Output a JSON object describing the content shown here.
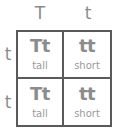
{
  "punnett_square": {
    "column_alleles": [
      "T",
      "t"
    ],
    "row_alleles": [
      "t",
      "t"
    ],
    "cells": [
      [
        {
          "genotype": "Tt",
          "phenotype": "tall"
        },
        {
          "genotype": "tt",
          "phenotype": "short"
        }
      ],
      [
        {
          "genotype": "Tt",
          "phenotype": "tall"
        },
        {
          "genotype": "tt",
          "phenotype": "short"
        }
      ]
    ]
  },
  "colors": {
    "grid_line": "#5a5a5a",
    "text": "#8c8c8c",
    "background": "#ffffff"
  }
}
